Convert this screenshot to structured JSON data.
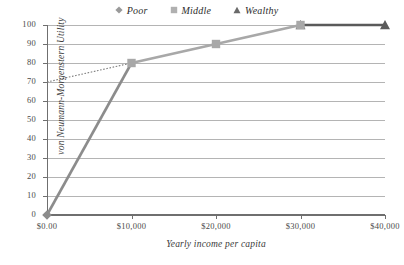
{
  "chart_data": {
    "type": "line",
    "title": "",
    "xlabel": "Yearly income per capita",
    "ylabel": "von Neumann-Morgenstern Utility",
    "grid": true,
    "legend_position": "top-center",
    "xlim": [
      0,
      40000
    ],
    "ylim": [
      0,
      100
    ],
    "x_tick_labels": [
      "$0.00",
      "$10,000",
      "$20,000",
      "$30,000",
      "$40,000"
    ],
    "x_tick_values": [
      0,
      10000,
      20000,
      30000,
      40000
    ],
    "y_tick_labels": [
      "0",
      "10",
      "20",
      "30",
      "40",
      "50",
      "60",
      "70",
      "80",
      "90",
      "100"
    ],
    "y_tick_values": [
      0,
      10,
      20,
      30,
      40,
      50,
      60,
      70,
      80,
      90,
      100
    ],
    "series": [
      {
        "name": "Poor",
        "marker": "diamond",
        "color": "#8c8c8c",
        "line_style": "solid",
        "x": [
          0,
          10000
        ],
        "y": [
          0,
          80
        ],
        "marker_x": [
          0
        ],
        "marker_y": [
          0
        ]
      },
      {
        "name": "Middle",
        "marker": "square",
        "color": "#a8a8a8",
        "line_style": "solid",
        "x": [
          0,
          10000,
          20000,
          30000
        ],
        "y": [
          70,
          80,
          90,
          100
        ],
        "dotted_segment_x": [
          0,
          10000
        ],
        "dotted_segment_y": [
          70,
          80
        ],
        "marker_x": [
          10000,
          20000,
          30000
        ],
        "marker_y": [
          80,
          90,
          100
        ]
      },
      {
        "name": "Wealthy",
        "marker": "triangle",
        "color": "#5a5a5a",
        "line_style": "solid",
        "x": [
          30000,
          40000
        ],
        "y": [
          100,
          100
        ],
        "marker_x": [
          30000,
          40000
        ],
        "marker_y": [
          100,
          100
        ]
      }
    ],
    "colors": {
      "grid": "#b4b4b4",
      "axis": "#6f6f6f",
      "text": "#3a3a3a",
      "background": "#ffffff"
    }
  },
  "legend": {
    "items": [
      {
        "label": "Poor",
        "marker": "diamond-marker",
        "color": "#9a9a9a"
      },
      {
        "label": "Middle",
        "marker": "square-marker",
        "color": "#b0b0b0"
      },
      {
        "label": "Wealthy",
        "marker": "triangle-marker",
        "color": "#6a6a6a"
      }
    ]
  }
}
